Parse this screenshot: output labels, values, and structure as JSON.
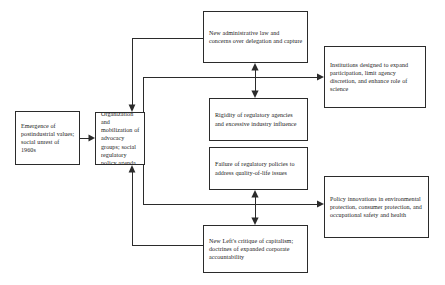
{
  "diagram": {
    "background_color": "#ffffff",
    "line_color": "#2b2b2b",
    "nodes": [
      {
        "id": "origins",
        "name": "origins-box",
        "text": "Emergence of postindustrial values; social unrest of 1960s"
      },
      {
        "id": "organization",
        "name": "organization-box",
        "text": "Organization and mobilization of advocacy groups; social regulatory policy agenda"
      },
      {
        "id": "admin-law",
        "name": "administrative-law-box",
        "text": "New administrative law and concerns over delegation and capture"
      },
      {
        "id": "rigidity",
        "name": "rigidity-box",
        "text": "Rigidity of regulatory agencies and excessive industry influence"
      },
      {
        "id": "failure",
        "name": "failure-box",
        "text": "Failure of regulatory policies to address quality-of-life issues"
      },
      {
        "id": "new-left",
        "name": "new-left-box",
        "text": "New Left's critique of capitalism; doctrines of expanded corporate accountability"
      },
      {
        "id": "institutions",
        "name": "institutions-box",
        "text": "Institutions designed to expand participation, limit agency discretion, and enhance role of science"
      },
      {
        "id": "policy-innovations",
        "name": "policy-innovations-box",
        "text": "Policy innovations in environmental protection, consumer protection, and occupational safety and health"
      }
    ],
    "connections": [
      {
        "name": "origins-to-organization",
        "from": "origins",
        "to": "organization",
        "style": "straight-arrow"
      },
      {
        "name": "admin-law-to-organization",
        "from": "admin-law",
        "to": "organization",
        "style": "elbow-arrow"
      },
      {
        "name": "organization-to-institutions",
        "from": "organization",
        "to": "institutions",
        "style": "elbow-arrow"
      },
      {
        "name": "admin-law-rigidity-link",
        "from": "admin-law",
        "to": "rigidity",
        "style": "double-arrow"
      },
      {
        "name": "new-left-to-organization",
        "from": "new-left",
        "to": "organization",
        "style": "elbow-arrow"
      },
      {
        "name": "organization-to-policy-innovations",
        "from": "organization",
        "to": "policy-innovations",
        "style": "elbow-arrow"
      },
      {
        "name": "failure-new-left-link",
        "from": "failure",
        "to": "new-left",
        "style": "double-arrow"
      }
    ]
  }
}
